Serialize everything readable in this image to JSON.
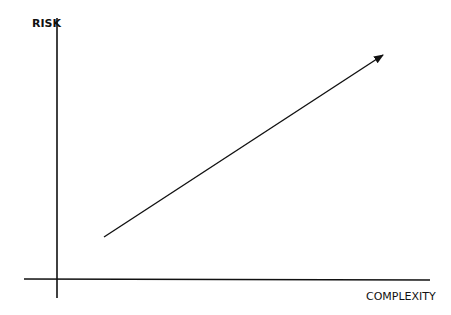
{
  "diagram": {
    "y_axis_label": "RISK",
    "x_axis_label": "COMPLEXITY",
    "arrow": {
      "from": [
        104,
        237
      ],
      "to": [
        384,
        55
      ],
      "meaning": "risk increases with complexity"
    },
    "colors": {
      "line": "#111111",
      "background": "#ffffff"
    }
  }
}
